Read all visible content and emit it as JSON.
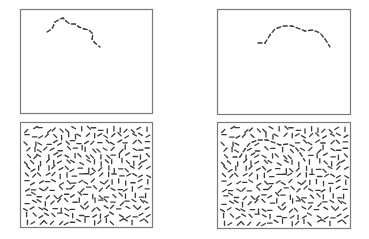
{
  "figure": {
    "colors": {
      "background": "#ffffff",
      "frame": "#7a7a7a",
      "stroke": "#3a3a3a"
    },
    "panels": [
      {
        "id": "top-left",
        "kind": "isolated-contour",
        "box": [
          20,
          9,
          132,
          104
        ],
        "contour": [
          [
            47,
            32
          ],
          [
            52,
            29
          ],
          [
            55,
            22
          ],
          [
            60,
            19
          ],
          [
            63,
            18
          ],
          [
            66,
            21
          ],
          [
            70,
            24
          ],
          [
            75,
            24
          ],
          [
            79,
            27
          ],
          [
            84,
            29
          ],
          [
            89,
            30
          ],
          [
            93,
            34
          ],
          [
            92,
            39
          ],
          [
            95,
            43
          ],
          [
            100,
            47
          ]
        ]
      },
      {
        "id": "top-right",
        "kind": "isolated-contour",
        "box": [
          217,
          9,
          133,
          105
        ],
        "contour": [
          [
            258,
            43
          ],
          [
            265,
            43
          ],
          [
            270,
            35
          ],
          [
            275,
            29
          ],
          [
            283,
            26
          ],
          [
            292,
            26
          ],
          [
            300,
            29
          ],
          [
            305,
            31
          ],
          [
            313,
            30
          ],
          [
            320,
            33
          ],
          [
            325,
            39
          ],
          [
            330,
            47
          ]
        ]
      },
      {
        "id": "bottom-left",
        "kind": "noise-field",
        "box": [
          20,
          122,
          132,
          105
        ],
        "seed": 7,
        "embedded_contour": null
      },
      {
        "id": "bottom-right",
        "kind": "noise-field-with-contour",
        "box": [
          217,
          122,
          133,
          106
        ],
        "seed": 7,
        "embedded_contour": [
          [
            233,
            157
          ],
          [
            240,
            157
          ],
          [
            245,
            149
          ],
          [
            250,
            143
          ],
          [
            258,
            140
          ],
          [
            267,
            140
          ],
          [
            275,
            143
          ],
          [
            280,
            145
          ],
          [
            288,
            144
          ],
          [
            295,
            147
          ],
          [
            300,
            153
          ],
          [
            305,
            161
          ]
        ]
      }
    ]
  }
}
